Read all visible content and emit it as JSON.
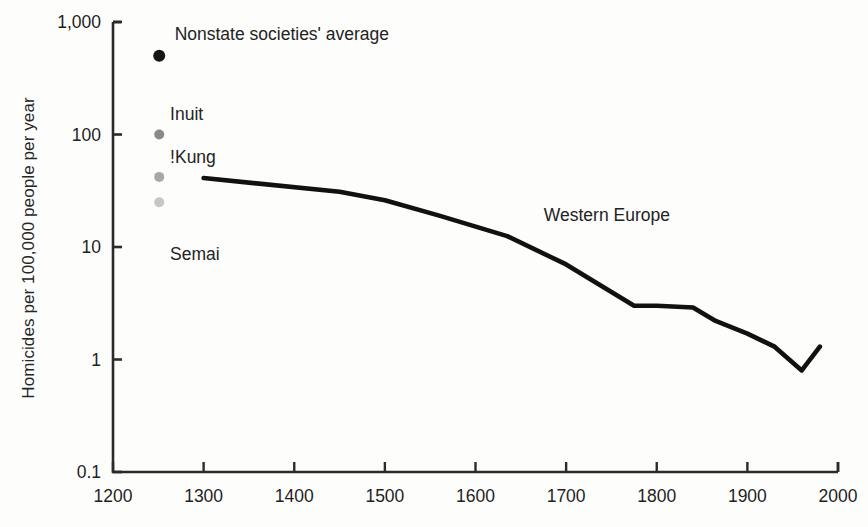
{
  "chart_data": {
    "type": "line",
    "title": "",
    "subtitle": "",
    "xlabel": "",
    "ylabel": "Homicides per 100,000 people per year",
    "y_scale": "log",
    "ylim": [
      0.1,
      1000
    ],
    "xlim": [
      1200,
      2000
    ],
    "grid": false,
    "legend_position": "inline-annotations",
    "y_ticks": [
      {
        "value": 1000,
        "label": "1,000"
      },
      {
        "value": 100,
        "label": "100"
      },
      {
        "value": 10,
        "label": "10"
      },
      {
        "value": 1,
        "label": "1"
      },
      {
        "value": 0.1,
        "label": "0.1"
      }
    ],
    "x_ticks": [
      {
        "value": 1200,
        "label": "1200"
      },
      {
        "value": 1300,
        "label": "1300"
      },
      {
        "value": 1400,
        "label": "1400"
      },
      {
        "value": 1500,
        "label": "1500"
      },
      {
        "value": 1600,
        "label": "1600"
      },
      {
        "value": 1700,
        "label": "1700"
      },
      {
        "value": 1800,
        "label": "1800"
      },
      {
        "value": 1900,
        "label": "1900"
      },
      {
        "value": 2000,
        "label": "2000"
      }
    ],
    "series": [
      {
        "name": "Western Europe",
        "type": "line",
        "color": "#111111",
        "annotation": "Western Europe",
        "annotation_x": 1745,
        "annotation_y": 17,
        "x": [
          1300,
          1450,
          1500,
          1560,
          1635,
          1700,
          1775,
          1800,
          1840,
          1865,
          1900,
          1930,
          1960,
          1980
        ],
        "y": [
          41,
          31,
          26,
          19,
          12.5,
          7.0,
          3.0,
          3.0,
          2.9,
          2.2,
          1.7,
          1.3,
          0.8,
          1.3
        ]
      }
    ],
    "points": [
      {
        "name": "Nonstate societies' average",
        "label": "Nonstate societies' average",
        "x": 1251,
        "y": 500,
        "color": "#151515",
        "radius": 6,
        "label_x": 1268,
        "label_y": 1000,
        "label_anchor": "start"
      },
      {
        "name": "Inuit",
        "label": "Inuit",
        "x": 1251,
        "y": 100,
        "color": "#8a8a8a",
        "radius": 5,
        "label_x": 1263,
        "label_y": 195,
        "label_anchor": "start"
      },
      {
        "name": "!Kung",
        "label": "!Kung",
        "x": 1251,
        "y": 42,
        "color": "#a8a8a8",
        "radius": 5,
        "label_x": 1263,
        "label_y": 80,
        "label_anchor": "start"
      },
      {
        "name": "Semai",
        "label": "Semai",
        "x": 1251,
        "y": 25,
        "color": "#c6c6c6",
        "radius": 5,
        "label_x": 1263,
        "label_y": 11,
        "label_anchor": "start"
      }
    ]
  },
  "axes": {
    "y_axis_title": "Homicides per 100,000 people per year",
    "frame_color": "#2a2a2a"
  }
}
